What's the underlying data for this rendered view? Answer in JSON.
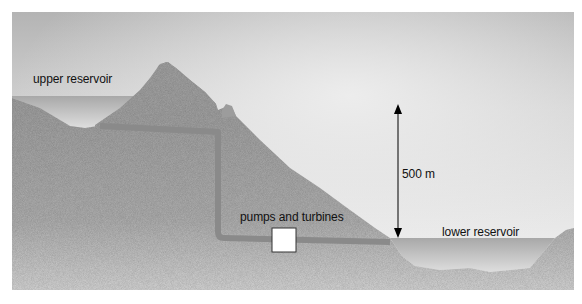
{
  "diagram": {
    "type": "pumped-storage-hydroelectric-cross-section",
    "labels": {
      "upper_reservoir": "upper reservoir",
      "pumps_and_turbines": "pumps and turbines",
      "height_difference": "500 m",
      "lower_reservoir": "lower reservoir"
    },
    "colors": {
      "sky_dark": "#b9b9b9",
      "sky_light": "#f2f2f2",
      "ground": "#9f9f9f",
      "ground_light": "#c8c8c8",
      "water": "#b2b2b2",
      "water_light": "#d6d6d6",
      "pipe": "#8c8c8c",
      "machine_box": "#ffffff",
      "arrow": "#000000",
      "text": "#111111"
    }
  }
}
